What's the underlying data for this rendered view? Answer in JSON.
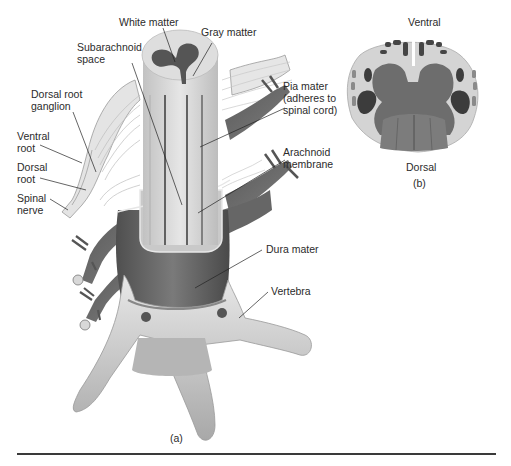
{
  "figure": {
    "panel_a": {
      "caption": "(a)",
      "labels": {
        "white_matter": "White matter",
        "gray_matter": "Gray matter",
        "subarachnoid_space": "Subarachnoid\nspace",
        "dorsal_root_ganglion": "Dorsal root\nganglion",
        "ventral_root": "Ventral\nroot",
        "dorsal_root": "Dorsal\nroot",
        "spinal_nerve": "Spinal\nnerve",
        "pia_mater": "Pia mater\n(adheres to\nspinal cord)",
        "arachnoid_membrane": "Arachnoid\nmembrane",
        "dura_mater": "Dura mater",
        "vertebra": "Vertebra"
      }
    },
    "panel_b": {
      "caption": "(b)",
      "labels": {
        "ventral": "Ventral",
        "dorsal": "Dorsal"
      }
    },
    "colors": {
      "white_matter": "#d9d9d9",
      "gray_matter": "#6e6e6e",
      "dark_tract": "#3c3c3c",
      "dura": "#6a6a6a",
      "bone": "#dcdcdc",
      "rule": "#3a3a3a"
    }
  }
}
